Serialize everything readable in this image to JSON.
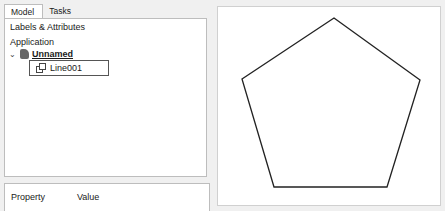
{
  "tabs": [
    {
      "label": "Model",
      "active": true
    },
    {
      "label": "Tasks",
      "active": false
    }
  ],
  "tree_panel": {
    "section_label": "Labels & Attributes",
    "group_label": "Application",
    "document": {
      "label": "Unnamed",
      "icon": "document-icon",
      "expanded": true
    },
    "items": [
      {
        "label": "Line001",
        "icon": "shape-icon",
        "selected": true
      }
    ]
  },
  "property_panel": {
    "columns": [
      "Property",
      "Value"
    ]
  },
  "viewport": {
    "shape": "pentagon",
    "points": [
      [
        116,
        11
      ],
      [
        202,
        73
      ],
      [
        169,
        180
      ],
      [
        56,
        180
      ],
      [
        24,
        72
      ]
    ],
    "stroke": "#222222"
  }
}
